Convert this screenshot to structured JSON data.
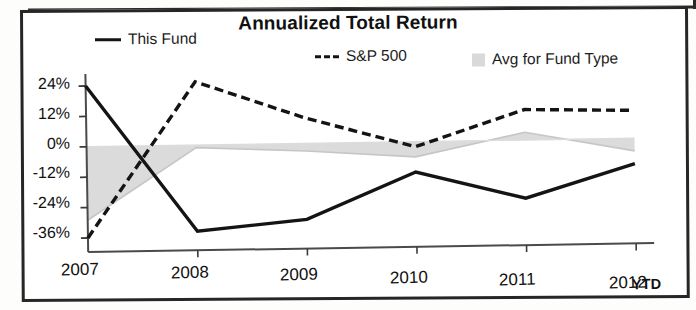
{
  "chart_data": {
    "type": "line",
    "title": "Annualized Total Return",
    "xlabel": "",
    "ylabel": "",
    "categories": [
      "2007",
      "2008",
      "2009",
      "2010",
      "2011",
      "2012"
    ],
    "last_category_note": "YTD",
    "ylim": [
      -42,
      30
    ],
    "ytick_labels": [
      "24%",
      "12%",
      "0%",
      "-12%",
      "-24%",
      "-36%"
    ],
    "ytick_values": [
      24,
      12,
      0,
      -12,
      -24,
      -36
    ],
    "grid": false,
    "legend_position": "top",
    "series": [
      {
        "name": "This Fund",
        "style": "solid-line",
        "color": "#141414",
        "values": [
          24,
          -34,
          -30,
          -12,
          -23,
          -10
        ]
      },
      {
        "name": "S&P 500",
        "style": "dashed-line",
        "color": "#141414",
        "values": [
          -36,
          25,
          10,
          -2,
          12,
          11
        ]
      },
      {
        "name": "Avg for Fund Type",
        "style": "shaded-area",
        "color": "#d9d9d9",
        "values": [
          -29,
          -1,
          -3,
          -6,
          3,
          -5
        ]
      }
    ]
  },
  "legend": {
    "items": [
      {
        "label": "This Fund",
        "swatch": "solid-line-swatch"
      },
      {
        "label": "S&P 500",
        "swatch": "dashed-line-swatch"
      },
      {
        "label": "Avg for Fund Type",
        "swatch": "gray-square-swatch"
      }
    ]
  },
  "axis": {
    "y_labels": [
      "24%",
      "12%",
      "0%",
      "-12%",
      "-24%",
      "-36%"
    ],
    "x_labels": [
      "2007",
      "2008",
      "2009",
      "2010",
      "2011",
      "2012"
    ],
    "ytd": "YTD"
  }
}
